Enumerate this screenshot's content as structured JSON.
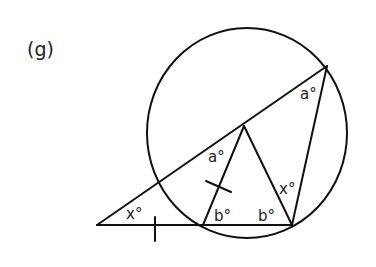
{
  "figure": {
    "label": "(g)",
    "angle_labels": {
      "a_top": "a°",
      "a_mid": "a°",
      "x_left": "x°",
      "b_left": "b°",
      "b_right": "b°",
      "x_right": "x°"
    },
    "colors": {
      "stroke": "#111111",
      "background": "#ffffff"
    }
  }
}
